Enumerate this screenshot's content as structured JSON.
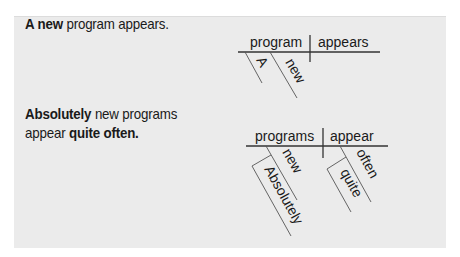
{
  "examples": [
    {
      "sentence": {
        "parts": [
          {
            "text": "A new",
            "bold": true
          },
          {
            "text": " program appears.",
            "bold": false
          }
        ]
      },
      "diagram": {
        "subject": "program",
        "verb": "appears",
        "subject_modifiers": [
          "A",
          "new"
        ],
        "verb_modifiers": []
      }
    },
    {
      "sentence": {
        "parts": [
          {
            "text": "Absolutely",
            "bold": true
          },
          {
            "text": " new programs",
            "bold": false
          },
          {
            "text": "appear ",
            "bold": false
          },
          {
            "text": "quite often.",
            "bold": true
          }
        ]
      },
      "diagram": {
        "subject": "programs",
        "verb": "appear",
        "subject_modifiers": [
          "new"
        ],
        "subject_modifier_modifiers": [
          "Absolutely"
        ],
        "verb_modifiers": [
          "often"
        ],
        "verb_modifier_modifiers": [
          "quite"
        ]
      }
    }
  ],
  "colors": {
    "panel_background": "#ebebeb",
    "text": "#1a1a1a",
    "lines": "#333333"
  }
}
